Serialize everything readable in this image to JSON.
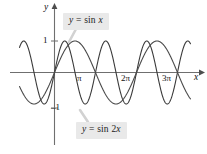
{
  "figure": {
    "background_color": "#ffffff",
    "width": 207,
    "height": 154
  },
  "axes": {
    "y_axis_label": "y",
    "x_axis_label": "x",
    "y_ticks": [
      {
        "label": "1",
        "value": 1
      },
      {
        "label": "–1",
        "value": -1
      }
    ],
    "x_ticks": [
      {
        "label": "π",
        "value": 3.14159
      },
      {
        "label": "2π",
        "value": 6.28319
      },
      {
        "label": "3π",
        "value": 9.42478
      }
    ],
    "axis_color": "#6f6f6f",
    "tick_color": "#6f6f6f"
  },
  "callouts": [
    {
      "id": "sin-x",
      "text": "y = sin x",
      "parts": {
        "lhs": "y",
        "eq": " = sin ",
        "rhs": "x"
      },
      "background_color": "#e9e9e9"
    },
    {
      "id": "sin-2x",
      "text": "y = sin 2x",
      "parts": {
        "lhs": "y",
        "eq": " = sin 2",
        "rhs": "x"
      },
      "background_color": "#e9e9e9"
    }
  ],
  "chart_data": {
    "type": "line",
    "title": "",
    "xlabel": "x",
    "ylabel": "y",
    "xlim": [
      -2.68,
      10.42
    ],
    "ylim": [
      -1.6,
      1.6
    ],
    "grid": false,
    "legend_position": "callout-annotations",
    "xticks": [
      3.14159,
      6.28319,
      9.42478
    ],
    "xticklabels": [
      "π",
      "2π",
      "3π"
    ],
    "yticks": [
      1,
      -1
    ],
    "yticklabels": [
      "1",
      "–1"
    ],
    "series": [
      {
        "name": "y = sin x",
        "equation": "y = sin(x)",
        "amplitude": 1,
        "period": 6.28319,
        "color": "#4a4a4a",
        "linewidth": 1.1,
        "x_domain": [
          -2.68,
          10.42
        ]
      },
      {
        "name": "y = sin 2x",
        "equation": "y = sin(2x)",
        "amplitude": 1,
        "period": 3.14159,
        "color": "#3a3a3a",
        "linewidth": 1.1,
        "x_domain": [
          -2.68,
          10.42
        ]
      }
    ],
    "annotations": [
      {
        "text": "y = sin x",
        "points_to_series": "y = sin x"
      },
      {
        "text": "y = sin 2x",
        "points_to_series": "y = sin 2x"
      }
    ]
  }
}
